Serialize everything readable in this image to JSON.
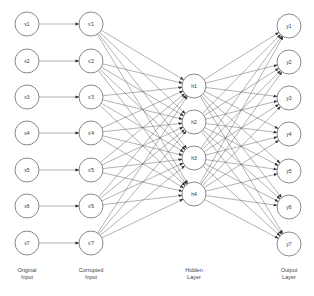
{
  "diagram": {
    "title": "",
    "colors": {
      "node_stroke": "#6b6b6b",
      "edge": "#555555",
      "text": "#333333",
      "background": "#ffffff"
    },
    "node_radius": 12,
    "layers": [
      {
        "id": "original",
        "label_lines": [
          "Original",
          "Input"
        ],
        "x": 27,
        "label_y": 272,
        "nodes": [
          {
            "id": "x1",
            "label": "x1",
            "y": 24
          },
          {
            "id": "x2",
            "label": "x2",
            "y": 61
          },
          {
            "id": "x3",
            "label": "x3",
            "y": 97
          },
          {
            "id": "x4",
            "label": "x4",
            "y": 133
          },
          {
            "id": "x5",
            "label": "x5",
            "y": 170
          },
          {
            "id": "x6",
            "label": "x6",
            "y": 206
          },
          {
            "id": "x7",
            "label": "x7",
            "y": 243
          }
        ]
      },
      {
        "id": "corrupted",
        "label_lines": [
          "Corrupted",
          "Input"
        ],
        "x": 91,
        "label_y": 272,
        "nodes": [
          {
            "id": "xc1",
            "label": "x'1",
            "y": 24
          },
          {
            "id": "xc2",
            "label": "x'2",
            "y": 61
          },
          {
            "id": "xc3",
            "label": "x'3",
            "y": 97
          },
          {
            "id": "xc4",
            "label": "x'4",
            "y": 133
          },
          {
            "id": "xc5",
            "label": "x'5",
            "y": 170
          },
          {
            "id": "xc6",
            "label": "x'6",
            "y": 206
          },
          {
            "id": "xc7",
            "label": "x'7",
            "y": 243
          }
        ]
      },
      {
        "id": "hidden",
        "label_lines": [
          "Hidden",
          "Layer"
        ],
        "x": 194,
        "label_y": 272,
        "nodes": [
          {
            "id": "h1",
            "label": "h1",
            "y": 86
          },
          {
            "id": "h2",
            "label": "h2",
            "y": 122
          },
          {
            "id": "h3",
            "label": "h3",
            "y": 158
          },
          {
            "id": "h4",
            "label": "h4",
            "y": 194
          }
        ]
      },
      {
        "id": "output",
        "label_lines": [
          "Output",
          "Layer"
        ],
        "x": 289,
        "label_y": 272,
        "nodes": [
          {
            "id": "y1",
            "label": "y1",
            "y": 26
          },
          {
            "id": "y2",
            "label": "y2",
            "y": 62
          },
          {
            "id": "y3",
            "label": "y3",
            "y": 98
          },
          {
            "id": "y4",
            "label": "y4",
            "y": 134
          },
          {
            "id": "y5",
            "label": "y5",
            "y": 171
          },
          {
            "id": "y6",
            "label": "y6",
            "y": 207
          },
          {
            "id": "y7",
            "label": "y7",
            "y": 244
          }
        ]
      }
    ],
    "connections": [
      {
        "from": "original",
        "to": "corrupted",
        "type": "one-to-one",
        "arrow": true
      },
      {
        "from": "corrupted",
        "to": "hidden",
        "type": "fully-connected",
        "arrow": true
      },
      {
        "from": "hidden",
        "to": "output",
        "type": "fully-connected",
        "arrow": true
      }
    ]
  }
}
